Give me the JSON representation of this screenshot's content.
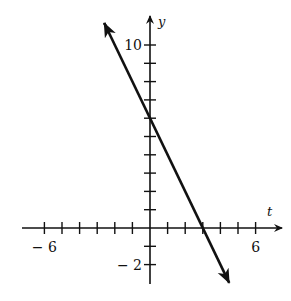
{
  "chart_data": {
    "type": "line",
    "title": "",
    "xlabel": "t",
    "ylabel": "y",
    "xlim": [
      -7,
      7
    ],
    "ylim": [
      -3,
      11
    ],
    "x_tick_step": 1,
    "y_tick_step": 1,
    "x_tick_labels": [
      {
        "value": -6,
        "text": "− 6"
      },
      {
        "value": 6,
        "text": "6"
      }
    ],
    "y_tick_labels": [
      {
        "value": 10,
        "text": "10"
      },
      {
        "value": -2,
        "text": "− 2"
      }
    ],
    "grid": false,
    "legend": null,
    "series": [
      {
        "name": "y = -2t + 6",
        "equation": "y = -2t + 6",
        "slope": -2,
        "intercept": 6,
        "x": [
          -2.6,
          4.5
        ],
        "y": [
          11.2,
          -3.0
        ],
        "arrows_both_ends": true
      }
    ],
    "axis_color": "#111111",
    "line_color": "#111111"
  }
}
